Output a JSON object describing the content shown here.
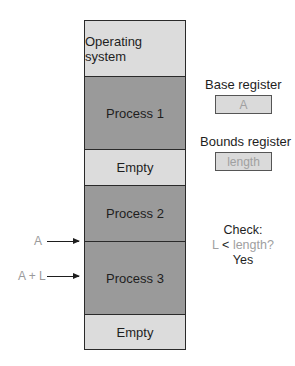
{
  "memory": {
    "segments": [
      {
        "label": "Operating system",
        "shade": "light",
        "top": 0,
        "height": 55
      },
      {
        "label": "Process 1",
        "shade": "dark",
        "top": 55,
        "height": 73
      },
      {
        "label": "Empty",
        "shade": "light",
        "top": 128,
        "height": 36
      },
      {
        "label": "Process 2",
        "shade": "dark",
        "top": 164,
        "height": 56
      },
      {
        "label": "Process 3",
        "shade": "dark",
        "top": 220,
        "height": 73
      },
      {
        "label": "Empty",
        "shade": "light",
        "top": 293,
        "height": 37
      }
    ]
  },
  "registers": {
    "base": {
      "label": "Base register",
      "value": "A"
    },
    "bounds": {
      "label": "Bounds register",
      "value": "length"
    }
  },
  "pointers": {
    "a": "A",
    "a_plus_l": "A + L"
  },
  "check": {
    "title": "Check:",
    "l": "L",
    "op": "<",
    "expr": "length?",
    "result": "Yes"
  },
  "colors": {
    "light_segment": "#dcdcdc",
    "dark_segment": "#9a9a9a",
    "muted_text": "#a0a0a0"
  }
}
